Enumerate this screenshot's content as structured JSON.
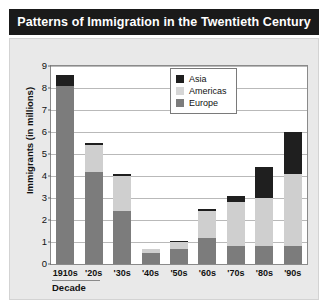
{
  "title": "Patterns of Immigration in the Twentieth Century",
  "axes": {
    "ylabel": "Immigrants (in millions)",
    "xlabel": "Decade",
    "yticks": [
      "0",
      "1",
      "2",
      "3",
      "4",
      "5",
      "6",
      "7",
      "8",
      "9"
    ]
  },
  "legend": {
    "items": [
      {
        "label": "Asia",
        "color": "#1f1f1f",
        "swatch_name": "legend-swatch-asia"
      },
      {
        "label": "Americas",
        "color": "#d6d6d6",
        "swatch_name": "legend-swatch-americas"
      },
      {
        "label": "Europe",
        "color": "#7c7c7c",
        "swatch_name": "legend-swatch-europe"
      }
    ]
  },
  "colors": {
    "title_banner": "#1a1a1a",
    "panel_background": "#e9e9e9",
    "plot_background": "#ffffff",
    "asia": "#1f1f1f",
    "americas": "#cfcfcf",
    "europe": "#7c7c7c",
    "gridline": "#b9b9b9",
    "axis": "#8a8a8a"
  },
  "chart_data": {
    "type": "bar",
    "title": "Patterns of Immigration in the Twentieth Century",
    "xlabel": "Decade",
    "ylabel": "Immigrants (in millions)",
    "ylim": [
      0,
      9
    ],
    "ytick_step": 1,
    "grid": true,
    "stacked": true,
    "stack_order_bottom_to_top": [
      "Europe",
      "Americas",
      "Asia"
    ],
    "legend_position": "inside-top-right",
    "categories": [
      "1910s",
      "'20s",
      "'30s",
      "'40s",
      "'50s",
      "'60s",
      "'70s",
      "'80s",
      "'90s"
    ],
    "series": [
      {
        "name": "Europe",
        "color": "#7c7c7c",
        "values": [
          8.1,
          4.2,
          2.4,
          0.5,
          0.7,
          1.2,
          0.8,
          0.8,
          0.8
        ]
      },
      {
        "name": "Americas",
        "color": "#cfcfcf",
        "values": [
          0.0,
          1.2,
          1.6,
          0.2,
          0.3,
          1.2,
          2.0,
          2.2,
          3.3
        ]
      },
      {
        "name": "Asia",
        "color": "#1f1f1f",
        "values": [
          0.5,
          0.1,
          0.1,
          0.0,
          0.05,
          0.1,
          0.3,
          1.4,
          1.9
        ]
      }
    ],
    "totals": [
      8.6,
      5.5,
      4.1,
      0.7,
      1.05,
      2.5,
      3.1,
      4.4,
      6.0
    ]
  }
}
